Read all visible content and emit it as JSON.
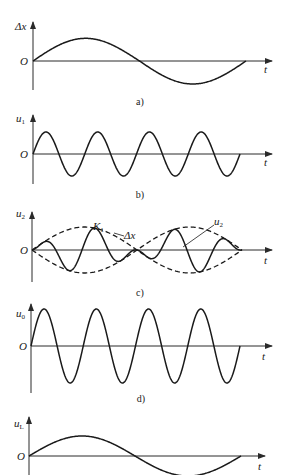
{
  "chart_data": [
    {
      "panel": "a",
      "type": "line",
      "title": "",
      "caption": "a)",
      "ylabel": "Δx",
      "xlabel": "t",
      "origin_label": "O",
      "description": "Slow half-period-like displacement signal: rises to positive maximum, crosses zero at mid-window, negative minimum, returns to zero",
      "series": [
        {
          "name": "Δx",
          "cycles": 1,
          "amplitude": 1.0,
          "style": "solid"
        }
      ],
      "x": [
        0,
        0.25,
        0.5,
        0.75,
        1.0
      ],
      "values": [
        0,
        1.0,
        0,
        -1.0,
        0
      ]
    },
    {
      "panel": "b",
      "type": "line",
      "caption": "b)",
      "ylabel": "u1",
      "xlabel": "t",
      "origin_label": "O",
      "description": "Constant-amplitude carrier sine wave, 4 full cycles",
      "series": [
        {
          "name": "u1",
          "cycles": 4,
          "amplitude": 1.0,
          "style": "solid"
        }
      ]
    },
    {
      "panel": "c",
      "type": "line",
      "caption": "c)",
      "ylabel": "u2",
      "xlabel": "t",
      "origin_label": "O",
      "annotations": [
        "K1",
        "Δx",
        "u2"
      ],
      "description": "Amplitude-modulated (suppressed-carrier) signal u2 with dashed envelope ±|Δx|; phase reversal at envelope zero crossing",
      "series": [
        {
          "name": "u2",
          "cycles": 4,
          "amplitude": "envelope",
          "style": "solid"
        },
        {
          "name": "Δx envelope",
          "style": "dashed",
          "values": "±|sin(πt)|"
        }
      ]
    },
    {
      "panel": "d",
      "type": "line",
      "caption": "d)",
      "ylabel": "u0",
      "xlabel": "t",
      "origin_label": "O",
      "description": "Constant-amplitude reference sine wave, 4 full cycles, larger amplitude",
      "series": [
        {
          "name": "u0",
          "cycles": 4,
          "amplitude": 1.0,
          "style": "solid"
        }
      ]
    },
    {
      "panel": "e",
      "type": "line",
      "caption": "",
      "ylabel": "uL",
      "xlabel": "t",
      "origin_label": "O",
      "description": "Demodulated output recovering Δx shape (cropped at bottom)",
      "series": [
        {
          "name": "uL",
          "cycles": 1,
          "amplitude": 1.0,
          "style": "solid"
        }
      ]
    }
  ],
  "labels": {
    "a": {
      "y": "Δx",
      "sub": "",
      "t": "t",
      "o": "O",
      "cap": "a)"
    },
    "b": {
      "y": "u",
      "sub": "1",
      "t": "t",
      "o": "O",
      "cap": "b)"
    },
    "c": {
      "y": "u",
      "sub": "2",
      "t": "t",
      "o": "O",
      "cap": "c)",
      "k1": "K",
      "k1sub": "1",
      "env": "Δx",
      "u2": "u",
      "u2sub": "2"
    },
    "d": {
      "y": "u",
      "sub": "0",
      "t": "t",
      "o": "O",
      "cap": "d)"
    },
    "e": {
      "y": "u",
      "sub": "L",
      "t": "t",
      "o": "O"
    }
  }
}
